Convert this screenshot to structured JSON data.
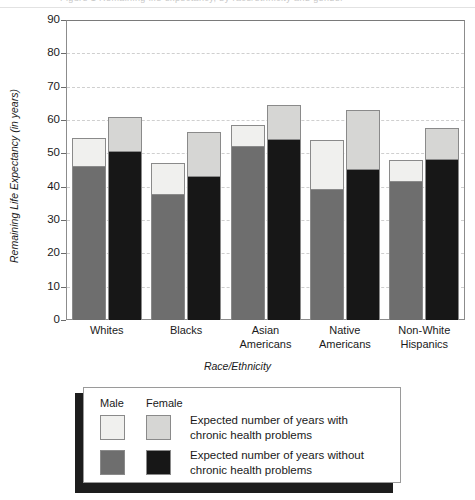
{
  "page": {
    "bleed_text": "Figure 1   Remaining life expectancy, by race/ethnicity and gender"
  },
  "chart_data": {
    "type": "bar",
    "title": "",
    "xlabel": "Race/Ethnicity",
    "ylabel": "Remaining Life Expectancy (in years)",
    "ylim": [
      0,
      90
    ],
    "ytick_step": 10,
    "yticks": [
      "90",
      "80",
      "70",
      "60",
      "50",
      "40",
      "30",
      "20",
      "10",
      "0"
    ],
    "grid": "horizontal-dashed",
    "stacked": true,
    "legend_position": "below-plot",
    "categories": [
      "Whites",
      "Blacks",
      "Asian Americans",
      "Native Americans",
      "Non-White Hispanics"
    ],
    "category_lines": [
      [
        "Whites"
      ],
      [
        "Blacks"
      ],
      [
        "Asian",
        "Americans"
      ],
      [
        "Native",
        "Americans"
      ],
      [
        "Non-White",
        "Hispanics"
      ]
    ],
    "series": [
      {
        "name": "Male - Expected number of years without chronic health problems",
        "gender": "Male",
        "segment": "without",
        "color": "#6e6e6e",
        "values": [
          46,
          37.5,
          52,
          39,
          41.5
        ]
      },
      {
        "name": "Male - Expected number of years with chronic health problems",
        "gender": "Male",
        "segment": "with",
        "color": "#f0f0ee",
        "values": [
          8.5,
          9.5,
          6.5,
          15,
          6.5
        ]
      },
      {
        "name": "Female - Expected number of years without chronic health problems",
        "gender": "Female",
        "segment": "without",
        "color": "#171717",
        "values": [
          50.5,
          43,
          54,
          45,
          48
        ]
      },
      {
        "name": "Female - Expected number of years with chronic health problems",
        "gender": "Female",
        "segment": "with",
        "color": "#d6d6d4",
        "values": [
          10.5,
          13.5,
          10.5,
          18,
          9.5
        ]
      }
    ],
    "totals": {
      "male": [
        54.5,
        47,
        58.5,
        54,
        48
      ],
      "female": [
        61,
        56.5,
        64.5,
        63,
        57.5
      ]
    }
  },
  "legend": {
    "header_male": "Male",
    "header_female": "Female",
    "rows": [
      {
        "male_color": "#f0f0ee",
        "female_color": "#d6d6d4",
        "line1": "Expected number of years with",
        "line2": "chronic health problems"
      },
      {
        "male_color": "#6e6e6e",
        "female_color": "#171717",
        "line1": "Expected number of years without",
        "line2": "chronic health problems"
      }
    ]
  }
}
